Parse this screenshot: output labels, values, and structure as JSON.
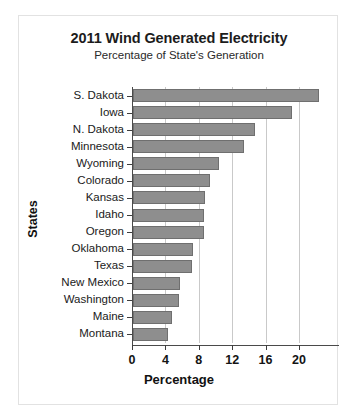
{
  "chart_data": {
    "type": "bar",
    "orientation": "horizontal",
    "title": "2011 Wind Generated Electricity",
    "subtitle": "Percentage of State's Generation",
    "xlabel": "Percentage",
    "ylabel": "States",
    "categories": [
      "S. Dakota",
      "Iowa",
      "N. Dakota",
      "Minnesota",
      "Wyoming",
      "Colorado",
      "Kansas",
      "Idaho",
      "Oregon",
      "Oklahoma",
      "Texas",
      "New Mexico",
      "Washington",
      "Maine",
      "Montana"
    ],
    "values": [
      22.3,
      19.0,
      14.6,
      13.3,
      10.3,
      9.2,
      8.6,
      8.5,
      8.5,
      7.2,
      7.1,
      5.6,
      5.5,
      4.7,
      4.2
    ],
    "xlim": [
      0,
      24.8
    ],
    "xticks": [
      0,
      4,
      8,
      12,
      16,
      20
    ],
    "xtick_labels": [
      "0",
      "4",
      "8",
      "12",
      "16",
      "20"
    ],
    "grid": true,
    "grid_axis": "x",
    "legend": false,
    "bar_color": "#8e8e8e",
    "bar_edge_color": "#6f6f6f",
    "background_color": "#ffffff",
    "frame_color": "#e2e2e2"
  }
}
